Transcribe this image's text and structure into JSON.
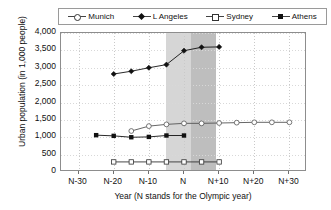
{
  "chart_data": {
    "type": "line",
    "title": "",
    "xlabel": "Year (N stands for the Olympic year)",
    "ylabel": "Urban population (in 1,000 people)",
    "x_ticklabels": [
      "N-30",
      "N-20",
      "N-10",
      "N",
      "N+10",
      "N+20",
      "N+30"
    ],
    "x_tickvalues": [
      -30,
      -20,
      -10,
      0,
      10,
      20,
      30
    ],
    "xlim": [
      -35,
      35
    ],
    "y_ticklabels": [
      "0",
      "500",
      "1,000",
      "1,500",
      "2,000",
      "2,500",
      "3,000",
      "3,500",
      "4,000"
    ],
    "y_tickvalues": [
      0,
      500,
      1000,
      1500,
      2000,
      2500,
      3000,
      3500,
      4000
    ],
    "ylim": [
      0,
      4000
    ],
    "grid": true,
    "legend_position": "top",
    "highlight_bands": [
      {
        "name": "olympic-period-light",
        "x_start": -5,
        "x_end": 9,
        "color": "#cfcfcf"
      },
      {
        "name": "olympic-period-dark",
        "x_start": 2,
        "x_end": 9,
        "color": "#bdbdbd"
      }
    ],
    "series": [
      {
        "name": "Munich",
        "marker": "open-square",
        "legend_marker": "open-circle",
        "color": "#333333",
        "x": [
          -20,
          -15,
          -10,
          -5,
          0,
          5,
          10
        ],
        "values": [
          290,
          290,
          290,
          290,
          290,
          290,
          290
        ]
      },
      {
        "name": "L Angeles",
        "marker": "filled-diamond",
        "legend_marker": "filled-diamond",
        "color": "#111111",
        "x": [
          -20,
          -15,
          -10,
          -5,
          0,
          5,
          10
        ],
        "values": [
          2820,
          2900,
          3000,
          3090,
          3490,
          3590,
          3600
        ]
      },
      {
        "name": "Sydney",
        "marker": "open-circle",
        "legend_marker": "open-square",
        "color": "#555555",
        "x": [
          -15,
          -10,
          -5,
          0,
          5,
          10,
          15,
          20,
          25,
          30
        ],
        "values": [
          1180,
          1320,
          1370,
          1400,
          1400,
          1410,
          1420,
          1430,
          1430,
          1430
        ]
      },
      {
        "name": "Athens",
        "marker": "filled-square",
        "legend_marker": "filled-square",
        "color": "#111111",
        "x": [
          -25,
          -20,
          -15,
          -10,
          -5,
          0
        ],
        "values": [
          1060,
          1040,
          1000,
          1010,
          1050,
          1050
        ]
      }
    ]
  },
  "legend": {
    "items": [
      {
        "label": "Munich",
        "marker": "open-circle"
      },
      {
        "label": "L  Angeles",
        "marker": "filled-diamond"
      },
      {
        "label": "Sydney",
        "marker": "open-square"
      },
      {
        "label": "Athens",
        "marker": "filled-square"
      }
    ]
  }
}
